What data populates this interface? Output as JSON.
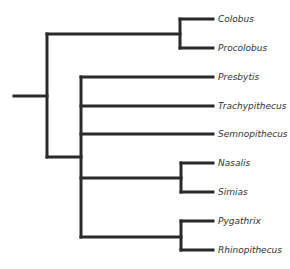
{
  "diagram": {
    "type": "phylogenetic-tree",
    "line_color": "#2a2a2a",
    "label_color": "#333333",
    "taxa": [
      {
        "label": "Colobus",
        "y": 19
      },
      {
        "label": "Procolobus",
        "y": 48
      },
      {
        "label": "Presbytis",
        "y": 77
      },
      {
        "label": "Trachypithecus",
        "y": 106
      },
      {
        "label": "Semnopithecus",
        "y": 134
      },
      {
        "label": "Nasalis",
        "y": 163
      },
      {
        "label": "Simias",
        "y": 192
      },
      {
        "label": "Pygathrix",
        "y": 221
      },
      {
        "label": "Rhinopithecus",
        "y": 250
      }
    ],
    "clades": [
      {
        "name": "Colobini",
        "members": [
          "Colobus",
          "Procolobus"
        ]
      },
      {
        "name": "Presbytini",
        "members": [
          "Presbytis",
          "Trachypithecus",
          "Semnopithecus",
          [
            "Nasalis",
            "Simias"
          ],
          [
            "Pygathrix",
            "Rhinopithecus"
          ]
        ]
      }
    ]
  }
}
